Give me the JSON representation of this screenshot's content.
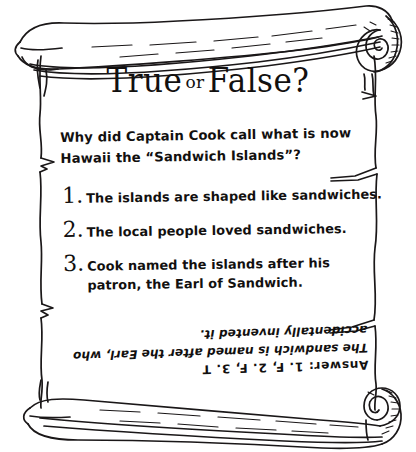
{
  "card": {
    "kind": "scroll-quiz-card",
    "paper_color": "#ffffff",
    "ink_color": "#12100f",
    "title": {
      "main_first": "True",
      "connector": "or",
      "main_second": "False?"
    },
    "question": "Why did Captain Cook call what is now Hawaii the “Sandwich Islands”?",
    "options": [
      {
        "number": "1.",
        "text": "The islands are shaped like sandwiches."
      },
      {
        "number": "2.",
        "text": "The local people loved sandwiches."
      },
      {
        "number": "3.",
        "text": "Cook named the islands after his patron, the Earl of Sandwich."
      }
    ],
    "answer": {
      "key": "Answer:  1. F,  2. F,  3. T",
      "note": "The sandwich is named after the Earl, who accidentally invented it.",
      "orientation": "upside-down"
    }
  }
}
